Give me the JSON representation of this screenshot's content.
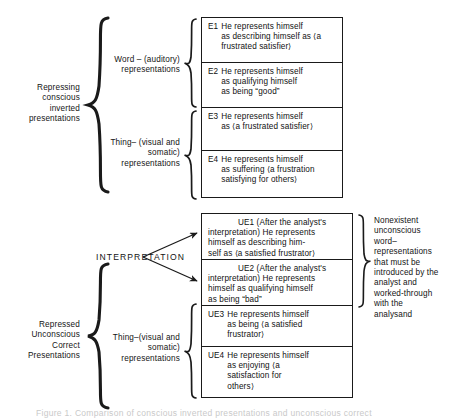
{
  "figure": {
    "caption_faint": "Figure   1.  Comparison of conscious inverted presentations and unconscious correct"
  },
  "upper": {
    "outer_label": "Repressing\nconscious\ninverted\npresentations",
    "word_group_label": "Word – (auditory)\nrepresentations",
    "thing_group_label": "Thing– (visual and\nsomatic)\nrepresentations",
    "items": [
      {
        "code": "E1",
        "text": "He represents himself\nas describing himself as ⟨a\nfrustrated satisfier⟩"
      },
      {
        "code": "E2",
        "text": "He represents himself\nas qualifying himself\nas being “good”"
      },
      {
        "code": "E3",
        "text": "He represents himself\nas ⟨a frustrated satisfier⟩"
      },
      {
        "code": "E4",
        "text": "He represents himself\nas suffering ⟨a frustration\nsatisfying for others⟩"
      }
    ]
  },
  "lower": {
    "outer_label": "Repressed\nUnconscious\nCorrect\nPresentations",
    "thing_group_label": "Thing–(visual and\nsomatic)\nrepresentations",
    "interpretation_label": "INTERPRETATION",
    "items": [
      {
        "code": "UE1",
        "text": "UE1 (After the analyst's\ninterpretation) He represents\nhimself as describing him-\nself as ⟨a satisfied frustrator⟩"
      },
      {
        "code": "UE2",
        "text": "UE2 (After the analyst's\ninterpretation) He represents\nhimself as qualifying himself\nas being “bad”"
      },
      {
        "code": "UE3",
        "text": "He represents himself\nas being ⟨a satisfied\nfrustrator⟩"
      },
      {
        "code": "UE4",
        "text": "He represents himself\nas enjoying ⟨a\nsatisfaction for\nothers⟩"
      }
    ],
    "right_annotation": "Nonexistent\nunconscious\nword–\nrepresentations\nthat must be\nintroduced by the\nanalyst and\nworked-through\nwith the\nanalysand"
  },
  "colors": {
    "ink": "#1a1a1a",
    "paper": "#ffffff",
    "caption_faint": "#c9c9c9"
  }
}
